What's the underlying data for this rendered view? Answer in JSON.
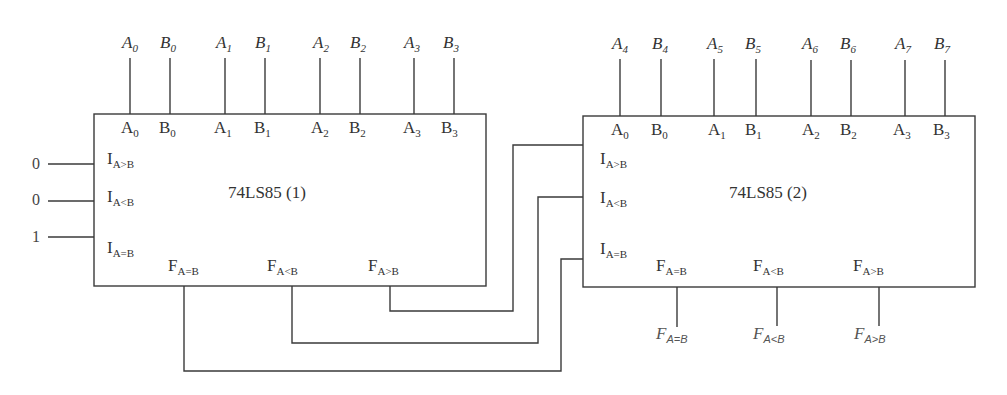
{
  "diagram": {
    "type": "circuit",
    "line_color": "#333333",
    "chips": [
      {
        "id": "chip1",
        "name": "74LS85 (1)",
        "pin_labels": [
          {
            "main": "A",
            "sub": "0"
          },
          {
            "main": "B",
            "sub": "0"
          },
          {
            "main": "A",
            "sub": "1"
          },
          {
            "main": "B",
            "sub": "1"
          },
          {
            "main": "A",
            "sub": "2"
          },
          {
            "main": "B",
            "sub": "2"
          },
          {
            "main": "A",
            "sub": "3"
          },
          {
            "main": "B",
            "sub": "3"
          }
        ],
        "external_inputs": [
          {
            "main": "A",
            "sub": "0"
          },
          {
            "main": "B",
            "sub": "0"
          },
          {
            "main": "A",
            "sub": "1"
          },
          {
            "main": "B",
            "sub": "1"
          },
          {
            "main": "A",
            "sub": "2"
          },
          {
            "main": "B",
            "sub": "2"
          },
          {
            "main": "A",
            "sub": "3"
          },
          {
            "main": "B",
            "sub": "3"
          }
        ],
        "cascade_inputs": [
          {
            "main": "I",
            "sub": "A>B",
            "value": "0"
          },
          {
            "main": "I",
            "sub": "A<B",
            "value": "0"
          },
          {
            "main": "I",
            "sub": "A=B",
            "value": "1"
          }
        ],
        "outputs": [
          {
            "main": "F",
            "sub": "A=B"
          },
          {
            "main": "F",
            "sub": "A<B"
          },
          {
            "main": "F",
            "sub": "A>B"
          }
        ]
      },
      {
        "id": "chip2",
        "name": "74LS85 (2)",
        "pin_labels": [
          {
            "main": "A",
            "sub": "0"
          },
          {
            "main": "B",
            "sub": "0"
          },
          {
            "main": "A",
            "sub": "1"
          },
          {
            "main": "B",
            "sub": "1"
          },
          {
            "main": "A",
            "sub": "2"
          },
          {
            "main": "B",
            "sub": "2"
          },
          {
            "main": "A",
            "sub": "3"
          },
          {
            "main": "B",
            "sub": "3"
          }
        ],
        "external_inputs": [
          {
            "main": "A",
            "sub": "4"
          },
          {
            "main": "B",
            "sub": "4"
          },
          {
            "main": "A",
            "sub": "5"
          },
          {
            "main": "B",
            "sub": "5"
          },
          {
            "main": "A",
            "sub": "6"
          },
          {
            "main": "B",
            "sub": "6"
          },
          {
            "main": "A",
            "sub": "7"
          },
          {
            "main": "B",
            "sub": "7"
          }
        ],
        "cascade_inputs": [
          {
            "main": "I",
            "sub": "A>B"
          },
          {
            "main": "I",
            "sub": "A<B"
          },
          {
            "main": "I",
            "sub": "A=B"
          }
        ],
        "outputs": [
          {
            "main": "F",
            "sub": "A=B"
          },
          {
            "main": "F",
            "sub": "A<B"
          },
          {
            "main": "F",
            "sub": "A>B"
          }
        ],
        "final_outputs": [
          {
            "main": "F",
            "sub": "A=B"
          },
          {
            "main": "F",
            "sub": "A<B"
          },
          {
            "main": "F",
            "sub": "A>B"
          }
        ]
      }
    ],
    "connections": [
      {
        "from": "74LS85 (1) F_A>B",
        "to": "74LS85 (2) I_A>B"
      },
      {
        "from": "74LS85 (1) F_A<B",
        "to": "74LS85 (2) I_A<B"
      },
      {
        "from": "74LS85 (1) F_A=B",
        "to": "74LS85 (2) I_A=B"
      }
    ]
  }
}
